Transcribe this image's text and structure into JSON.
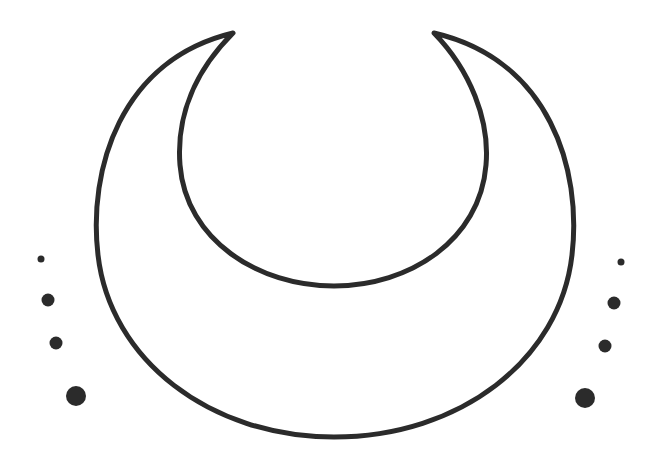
{
  "illustration": {
    "subject": "crescent-moon",
    "orientation": "horns-up",
    "stroke_color": "#2b2b2b",
    "fill_color": "#ffffff",
    "background": "#ffffff"
  },
  "dots": {
    "left": [
      {
        "cx": 41,
        "cy": 259,
        "r": 3.5
      },
      {
        "cx": 48,
        "cy": 300,
        "r": 6.5
      },
      {
        "cx": 56,
        "cy": 343,
        "r": 6.5
      },
      {
        "cx": 76,
        "cy": 396,
        "r": 10
      }
    ],
    "right": [
      {
        "cx": 621,
        "cy": 262,
        "r": 3.5
      },
      {
        "cx": 614,
        "cy": 303,
        "r": 6.5
      },
      {
        "cx": 605,
        "cy": 346,
        "r": 6.5
      },
      {
        "cx": 585,
        "cy": 398,
        "r": 10
      }
    ],
    "color": "#2b2b2b"
  }
}
